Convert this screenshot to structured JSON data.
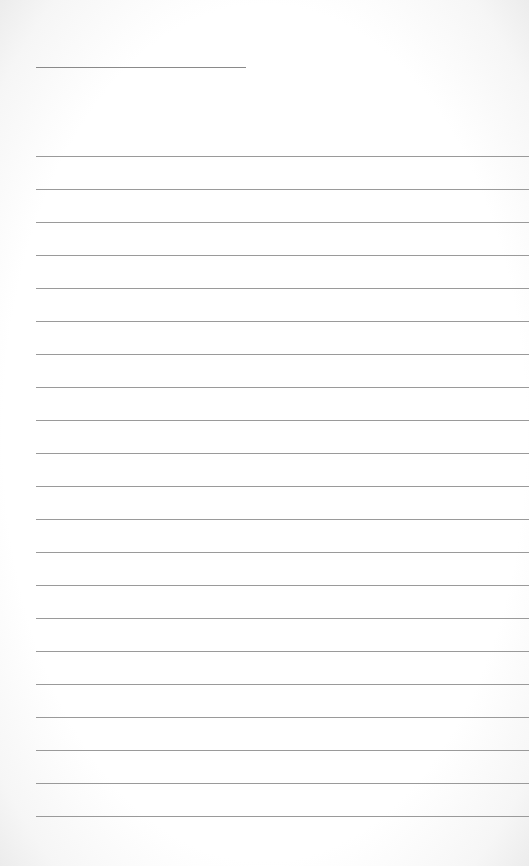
{
  "document": {
    "type": "lined-paper",
    "title_line": {
      "present": true
    },
    "rules": {
      "count": 21,
      "first_y": 156,
      "spacing": 33
    },
    "colors": {
      "paper": "#ffffff",
      "rule": "#9a9a9a"
    }
  }
}
